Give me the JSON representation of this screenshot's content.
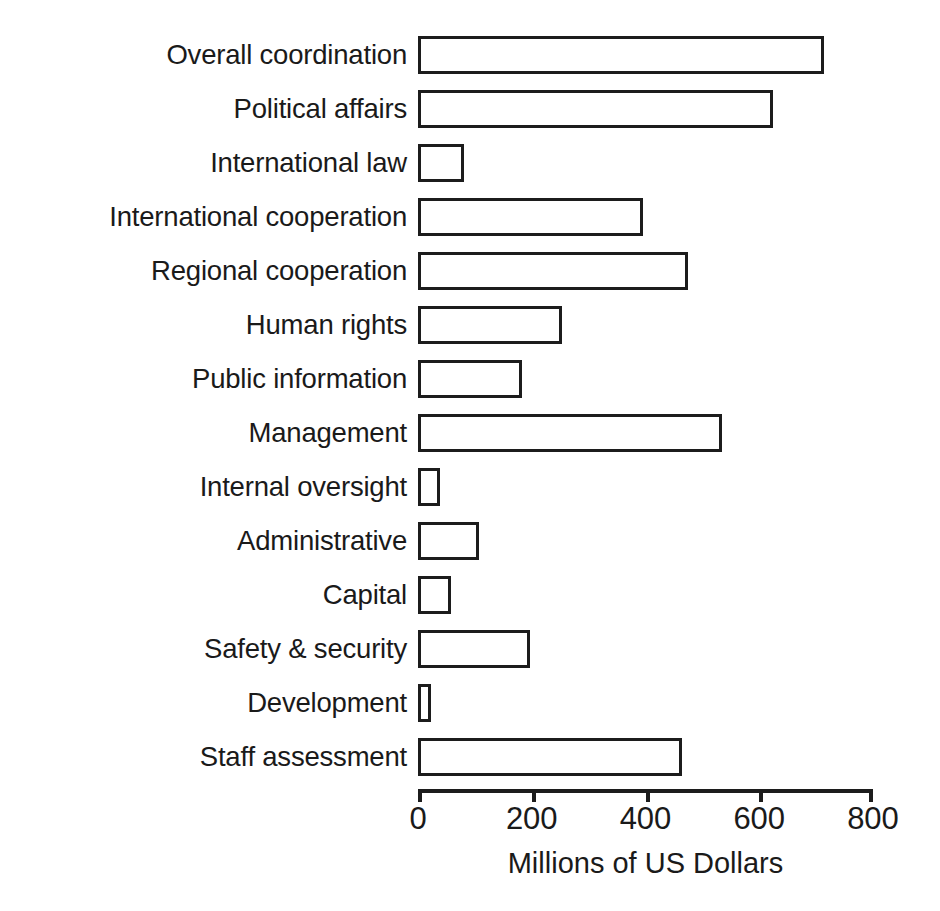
{
  "chart_data": {
    "type": "bar",
    "orientation": "horizontal",
    "title": "",
    "xlabel": "Millions of US Dollars",
    "ylabel": "",
    "xlim": [
      0,
      800
    ],
    "xticks": [
      0,
      200,
      400,
      600,
      800
    ],
    "xticklabels": [
      "0",
      "200",
      "400",
      "600",
      "800"
    ],
    "grid": false,
    "legend": null,
    "bar_style": {
      "facecolor": "#ffffff",
      "edgecolor": "#1c1c1c",
      "linewidth": 3.5
    },
    "categories": [
      "Overall coordination",
      "Political affairs",
      "International law",
      "International cooperation",
      "Regional cooperation",
      "Human rights",
      "Public information",
      "Management",
      "Internal oversight",
      "Administrative",
      "Capital",
      "Safety & security",
      "Development",
      "Staff assessment"
    ],
    "values": [
      714,
      624,
      81,
      396,
      474,
      253,
      183,
      535,
      39,
      107,
      58,
      197,
      23,
      464
    ]
  },
  "axis": {
    "title": "Millions of US Dollars",
    "tick_labels": [
      "0",
      "200",
      "400",
      "600",
      "800"
    ]
  },
  "colors": {
    "background": "#ffffff",
    "ink": "#1c1c1c",
    "text": "#1a1a1a"
  }
}
